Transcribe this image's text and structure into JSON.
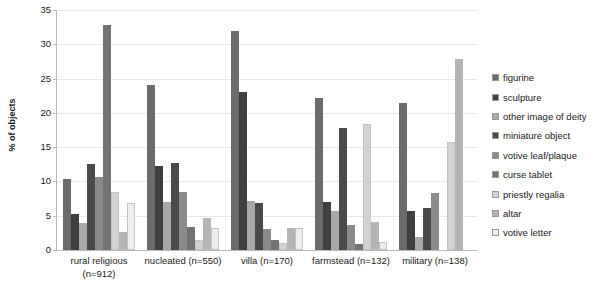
{
  "chart_data": {
    "type": "bar",
    "title": "",
    "xlabel": "",
    "ylabel": "% of objects",
    "ylim": [
      0,
      35
    ],
    "ytick_values": [
      0,
      5,
      10,
      15,
      20,
      25,
      30,
      35
    ],
    "ytick_labels": [
      "0",
      "5",
      "10",
      "15",
      "20",
      "25",
      "30",
      "35"
    ],
    "grid": true,
    "legend_position": "right",
    "categories": [
      "rural religious (n=912)",
      "nucleated (n=550)",
      "villa (n=170)",
      "farmstead (n=132)",
      "military (n=138)"
    ],
    "category_lines": [
      [
        "rural religious",
        "(n=912)"
      ],
      [
        "nucleated (n=550)",
        ""
      ],
      [
        "villa (n=170)",
        ""
      ],
      [
        "farmstead (n=132)",
        ""
      ],
      [
        "military (n=138)",
        ""
      ]
    ],
    "series": [
      {
        "name": "figurine",
        "color": "#6b6b6b",
        "values": [
          10.4,
          24.0,
          31.9,
          22.2,
          21.4
        ]
      },
      {
        "name": "sculpture",
        "color": "#3f3f3f",
        "values": [
          5.2,
          12.3,
          23.1,
          7.0,
          5.7
        ]
      },
      {
        "name": "other image of deity",
        "color": "#a8a8a8",
        "values": [
          4.0,
          7.0,
          7.2,
          5.7,
          1.9
        ]
      },
      {
        "name": "miniature object",
        "color": "#4a4a4a",
        "values": [
          12.6,
          12.7,
          6.8,
          17.8,
          6.2
        ]
      },
      {
        "name": "votive leaf/plaque",
        "color": "#8a8a8a",
        "values": [
          10.6,
          8.4,
          3.1,
          3.6,
          8.3
        ]
      },
      {
        "name": "curse tablet",
        "color": "#737373",
        "values": [
          32.8,
          3.4,
          1.5,
          0.9,
          0.0
        ]
      },
      {
        "name": "priestly regalia",
        "color": "#d2d2d2",
        "values": [
          8.5,
          1.5,
          1.0,
          18.4,
          15.7
        ]
      },
      {
        "name": "altar",
        "color": "#b5b5b5",
        "values": [
          2.6,
          4.6,
          3.2,
          4.1,
          27.8
        ]
      },
      {
        "name": "votive letter",
        "color": "#ededed",
        "values": [
          6.9,
          3.2,
          3.2,
          1.1,
          0.0
        ]
      }
    ]
  },
  "legend": {
    "items": [
      {
        "label": "figurine",
        "swatch_name": "legend-swatch-figurine"
      },
      {
        "label": "sculpture",
        "swatch_name": "legend-swatch-sculpture"
      },
      {
        "label": "other image of deity",
        "swatch_name": "legend-swatch-other-image-of-deity"
      },
      {
        "label": "miniature object",
        "swatch_name": "legend-swatch-miniature-object"
      },
      {
        "label": "votive leaf/plaque",
        "swatch_name": "legend-swatch-votive-leaf-plaque"
      },
      {
        "label": "curse tablet",
        "swatch_name": "legend-swatch-curse-tablet"
      },
      {
        "label": "priestly regalia",
        "swatch_name": "legend-swatch-priestly-regalia"
      },
      {
        "label": "altar",
        "swatch_name": "legend-swatch-altar"
      },
      {
        "label": "votive letter",
        "swatch_name": "legend-swatch-votive-letter"
      }
    ]
  },
  "style": {
    "background": "#ffffff",
    "gridline_color": "#e9e9e9",
    "axis_color": "#b8b8b8",
    "text_color": "#1a1a1a"
  }
}
